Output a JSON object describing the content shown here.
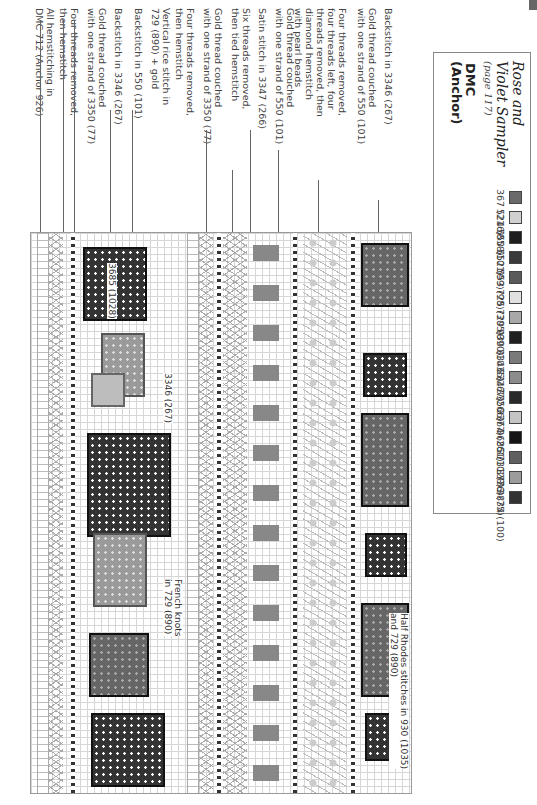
{
  "key": {
    "title_line1": "Rose and",
    "title_line2": "Violet Sampler",
    "page_ref": "(page 117)",
    "header_line1": "DMC",
    "header_line2": "(Anchor)",
    "items": [
      {
        "label": "367 (216)",
        "color": "#6a6a6a",
        "symbol": "x"
      },
      {
        "label": "524 (858)",
        "color": "#d0d0d0",
        "symbol": "triangle"
      },
      {
        "label": "550 (101)",
        "color": "#1e1e1e",
        "symbol": "circle"
      },
      {
        "label": "552 (99)",
        "color": "#3a3a3a",
        "symbol": "dot"
      },
      {
        "label": "553 (98)",
        "color": "#5a5a5a",
        "symbol": "dot"
      },
      {
        "label": "725 (305)",
        "color": "#e0e0e0",
        "symbol": "plus"
      },
      {
        "label": "729 (890)",
        "color": "#a8a8a8",
        "symbol": "arrow"
      },
      {
        "label": "930 (1035)",
        "color": "#202020",
        "symbol": "triangle-white"
      },
      {
        "label": "3346 (267)",
        "color": "#7a7a7a",
        "symbol": "square"
      },
      {
        "label": "3347 (266)",
        "color": "#8c8c8c",
        "symbol": "x"
      },
      {
        "label": "3350 (77)",
        "color": "#2a2a2a",
        "symbol": "slash"
      },
      {
        "label": "3364 (261)",
        "color": "#c4c4c4",
        "symbol": "bar"
      },
      {
        "label": "3685 (1028)",
        "color": "#151515",
        "symbol": "caret"
      },
      {
        "label": "3731 (76)",
        "color": "#606060",
        "symbol": "slash"
      },
      {
        "label": "3733 (75)",
        "color": "#9c9c9c",
        "symbol": "star"
      },
      {
        "label": "3834 (100)",
        "color": "#333333",
        "symbol": "solid"
      }
    ]
  },
  "callouts": [
    {
      "text_line1": "All hemstitching in",
      "text_line2": "DMC 712 (Anchor 926)"
    },
    {
      "text_line1": "Four threads removed,",
      "text_line2": "then hemstitch"
    },
    {
      "text_line1": "Gold thread couched",
      "text_line2": "with one strand of 3350 (77)"
    },
    {
      "text_line1": "Backstitch in 3346 (267)",
      "text_line2": ""
    },
    {
      "text_line1": "Backstitch in 550 (101)",
      "text_line2": ""
    },
    {
      "text_line1": "Vertical rice stitch in",
      "text_line2": "729 (890) + gold"
    },
    {
      "text_line1": "Four threads removed,",
      "text_line2": "then hemstitch"
    },
    {
      "text_line1": "Gold thread couched",
      "text_line2": "with one strand of 3350 (77)"
    },
    {
      "text_line1": "Six threads removed,",
      "text_line2": "then tied hemstitch"
    },
    {
      "text_line1": "Satin stitch in 3347 (266)",
      "text_line2": ""
    },
    {
      "text_line1": "Gold thread couched",
      "text_line2": "with one strand of 550 (101)"
    },
    {
      "text_line1": "Four threads removed,",
      "text_line2": "four threads left, four",
      "text_line3": "threads removed, then",
      "text_line4": "diamond hemstitch",
      "text_line5": "with pearl beads"
    },
    {
      "text_line1": "Gold thread couched",
      "text_line2": "with one strand of 550 (101)"
    },
    {
      "text_line1": "Backstitch in 3346 (267)",
      "text_line2": ""
    }
  ],
  "inline_labels": {
    "l3685": "3685 (1028)",
    "l3346": "3346 (267)",
    "french_knots_1": "French knots",
    "french_knots_2": "in 729 (890)",
    "half_rhodes_1": "Half Rhodes stitches in 930 (1035)",
    "half_rhodes_2": "and 729 (890)"
  }
}
